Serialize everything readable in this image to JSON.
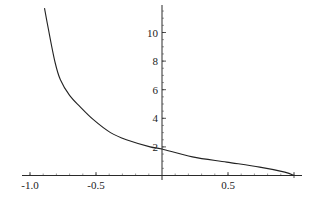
{
  "chart_data": {
    "type": "line",
    "title": "",
    "xlabel": "",
    "ylabel": "",
    "xlim": [
      -1.05,
      1.06
    ],
    "ylim": [
      0,
      11.9
    ],
    "grid": false,
    "legend": null,
    "axes_origin": [
      0,
      0
    ],
    "x_ticks": [
      -1.0,
      -0.5,
      0.5
    ],
    "x_tick_labels": [
      "-1.0",
      "-0.5",
      "0.5"
    ],
    "x_minor_step": 0.1,
    "y_ticks": [
      2,
      4,
      6,
      8,
      10
    ],
    "y_tick_labels": [
      "2",
      "4",
      "6",
      "8",
      "10"
    ],
    "y_minor_step": 0.5,
    "series": [
      {
        "name": "f(x)",
        "color": "#222222",
        "x": [
          -0.89,
          -0.86,
          -0.81,
          -0.77,
          -0.7,
          -0.62,
          -0.52,
          -0.39,
          -0.27,
          -0.09,
          0.0,
          0.23,
          0.49,
          0.74,
          0.93,
          1.0
        ],
        "y": [
          11.7,
          10.2,
          7.9,
          6.7,
          5.6,
          4.8,
          3.9,
          3.0,
          2.5,
          2.0,
          1.85,
          1.3,
          0.94,
          0.59,
          0.24,
          0.0
        ]
      }
    ]
  },
  "labels": {
    "x_tick_neg1": "-1.0",
    "x_tick_neg05": "-0.5",
    "x_tick_05": "0.5",
    "y_tick_2": "2",
    "y_tick_4": "4",
    "y_tick_6": "6",
    "y_tick_8": "8",
    "y_tick_10": "10"
  }
}
